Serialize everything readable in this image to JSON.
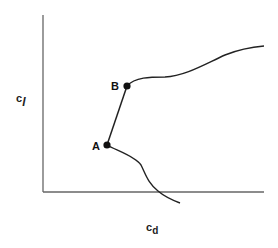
{
  "diagram": {
    "title": "",
    "x_axis": {
      "label_main": "c",
      "label_sub": "d"
    },
    "y_axis": {
      "label_main": "c",
      "label_sub": "l"
    },
    "points": [
      {
        "id": "A",
        "label": "A"
      },
      {
        "id": "B",
        "label": "B"
      }
    ],
    "colors": {
      "axis": "#666666",
      "curve": "#222222",
      "point": "#111111"
    }
  }
}
